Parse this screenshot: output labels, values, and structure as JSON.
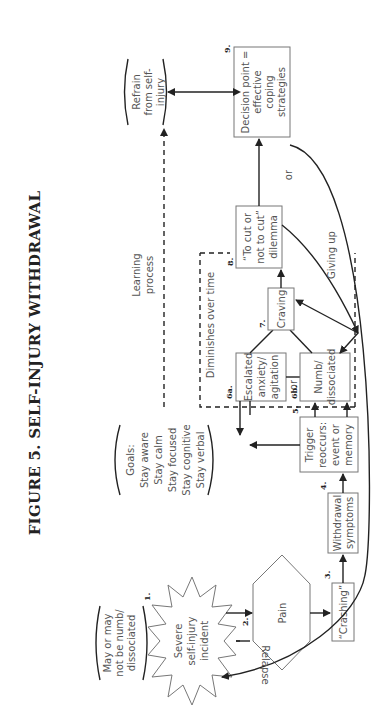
{
  "title": "FIGURE 5. SELF-INJURY WITHDRAWAL",
  "nodes": {
    "n1": {
      "num": "1.",
      "lines": [
        "Severe",
        "self-injury",
        "incident"
      ],
      "shape": "starburst"
    },
    "n1_note": {
      "lines": [
        "May or may",
        "not be numb/",
        "dissociated"
      ]
    },
    "n2": {
      "num": "2.",
      "lines": [
        "Pain"
      ],
      "shape": "hexagon"
    },
    "n3": {
      "num": "3.",
      "lines": [
        "“Crashing”"
      ]
    },
    "n4": {
      "num": "4.",
      "lines": [
        "Withdrawal",
        "symptoms"
      ]
    },
    "n5": {
      "num": "5.",
      "lines": [
        "Trigger",
        "reoccurs:",
        "event or",
        "memory"
      ]
    },
    "n6a": {
      "num": "6a.",
      "lines": [
        "Escalated",
        "anxiety/",
        "agitation"
      ]
    },
    "n6b": {
      "num": "6b.",
      "lines": [
        "Numb/",
        "dissociated"
      ]
    },
    "n7": {
      "num": "7.",
      "lines": [
        "Craving"
      ]
    },
    "n8": {
      "num": "8.",
      "lines": [
        "“To cut or",
        "not to cut”",
        "dilemma"
      ]
    },
    "n9": {
      "num": "9.",
      "lines": [
        "Decision point =",
        "effective",
        "coping",
        "strategies"
      ]
    },
    "goals": {
      "lines": [
        "Goals:",
        "Stay aware",
        "Stay calm",
        "Stay focused",
        "Stay cognitive",
        "Stay verbal"
      ]
    },
    "refrain": {
      "lines": [
        "Refrain",
        "from self-",
        "injury"
      ]
    }
  },
  "labels": {
    "or_6": "or",
    "or_9": "or",
    "diminishes": "Diminishes over time",
    "learning": [
      "Learning",
      "process"
    ],
    "giving_up": "Giving up",
    "relapse": "Relapse"
  }
}
